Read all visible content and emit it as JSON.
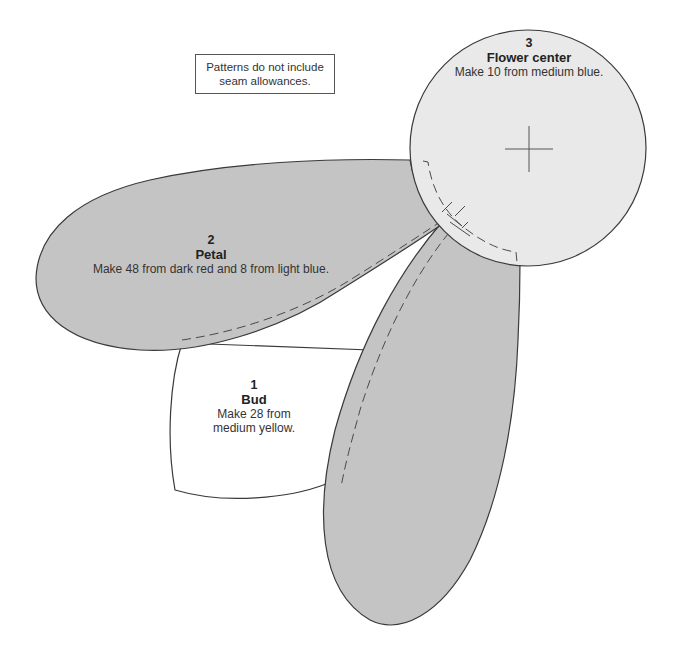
{
  "note": {
    "line1": "Patterns do not include",
    "line2": "seam allowances."
  },
  "pieces": [
    {
      "number": "1",
      "name": "Bud",
      "instruction_line1": "Make 28 from",
      "instruction_line2": "medium yellow.",
      "fill": "#ffffff"
    },
    {
      "number": "2",
      "name": "Petal",
      "instruction": "Make 48 from dark red and 8 from light blue.",
      "fill": "#c4c4c4"
    },
    {
      "number": "3",
      "name": "Flower center",
      "instruction": "Make 10 from medium blue.",
      "fill": "#e9e9e9"
    }
  ],
  "colors": {
    "outline": "#3a3a3a",
    "dashed": "#4a4a4a",
    "petal_fill": "#c4c4c4",
    "center_fill": "#e9e9e9"
  }
}
